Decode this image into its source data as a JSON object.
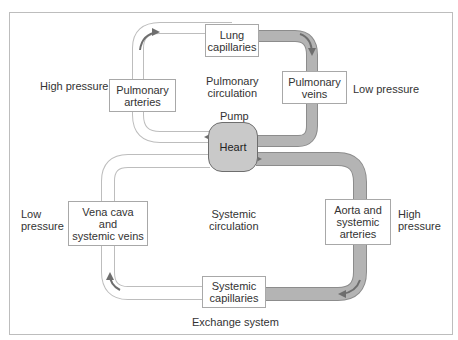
{
  "diagram": {
    "type": "circulatory-system-flow",
    "colors": {
      "frame": "#bdbdbd",
      "low_oxygen_pipe_fill": "#ffffff",
      "low_oxygen_pipe_stroke": "#bdbdbd",
      "high_oxygen_pipe_fill": "#b4b4b4",
      "high_oxygen_pipe_stroke": "#8c8c8c",
      "heart_fill": "#c9c9c9",
      "arrow": "#6e6e6e"
    },
    "nodes": {
      "lung_capillaries": "Lung\ncapillaries",
      "pulmonary_arteries": "Pulmonary\narteries",
      "pulmonary_veins": "Pulmonary\nveins",
      "heart": "Heart",
      "vena_cava": "Vena cava\nand\nsystemic veins",
      "aorta": "Aorta and\nsystemic\narteries",
      "systemic_capillaries": "Systemic\ncapillaries"
    },
    "labels": {
      "pump": "Pump",
      "pulmonary_circulation": "Pulmonary\ncirculation",
      "systemic_circulation": "Systemic\ncirculation",
      "high_pressure_left": "High pressure",
      "low_pressure_right": "Low pressure",
      "low_pressure_left": "Low\npressure",
      "high_pressure_right": "High\npressure",
      "exchange_system": "Exchange system"
    },
    "edges": [
      {
        "from": "Heart",
        "to": "Pulmonary arteries"
      },
      {
        "from": "Pulmonary arteries",
        "to": "Lung capillaries"
      },
      {
        "from": "Lung capillaries",
        "to": "Pulmonary veins"
      },
      {
        "from": "Pulmonary veins",
        "to": "Heart"
      },
      {
        "from": "Heart",
        "to": "Aorta and systemic arteries"
      },
      {
        "from": "Aorta and systemic arteries",
        "to": "Systemic capillaries"
      },
      {
        "from": "Systemic capillaries",
        "to": "Vena cava and systemic veins"
      },
      {
        "from": "Vena cava and systemic veins",
        "to": "Heart"
      }
    ]
  }
}
